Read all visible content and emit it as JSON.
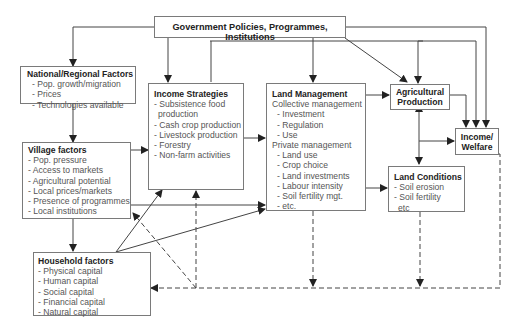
{
  "diagram": {
    "government": {
      "title": "Government Policies, Programmes, Institutions"
    },
    "national": {
      "title": "National/Regional Factors",
      "items": [
        "- Pop. growth/migration",
        "- Prices",
        "- Technologies available"
      ]
    },
    "village": {
      "title": "Village factors",
      "items": [
        "- Pop. pressure",
        "- Access to markets",
        "- Agricultural potential",
        "- Local prices/markets",
        "- Presence of programmes",
        "- Local institutions"
      ]
    },
    "household": {
      "title": "Household factors",
      "items": [
        "- Physical capital",
        "- Human  capital",
        "- Social capital",
        "- Financial capital",
        "- Natural capital"
      ]
    },
    "income_strategies": {
      "title": "Income Strategies",
      "items": [
        "- Subsistence food",
        "  production",
        "- Cash crop production",
        "- Livestock production",
        "- Forestry",
        "- Non-farm activities"
      ]
    },
    "land_management": {
      "title": "Land Management",
      "collective_label": "Collective management",
      "collective_items": [
        "- Investment",
        "- Regulation",
        "- Use"
      ],
      "private_label": "Private management",
      "private_items": [
        "- Land use",
        "- Crop choice",
        "- Land investments",
        "- Labour intensity",
        "- Soil fertility mgt.",
        "- etc."
      ]
    },
    "agri_production": {
      "title_line1": "Agricultural",
      "title_line2": "Production"
    },
    "income_welfare": {
      "title_line1": "Income/",
      "title_line2": "Welfare"
    },
    "land_conditions": {
      "title": "Land Conditions",
      "items": [
        "- Soil erosion",
        "- Soil fertility",
        "  etc"
      ]
    },
    "colors": {
      "line": "#333333",
      "border": "#7a7a7a",
      "text": "#555555"
    }
  }
}
